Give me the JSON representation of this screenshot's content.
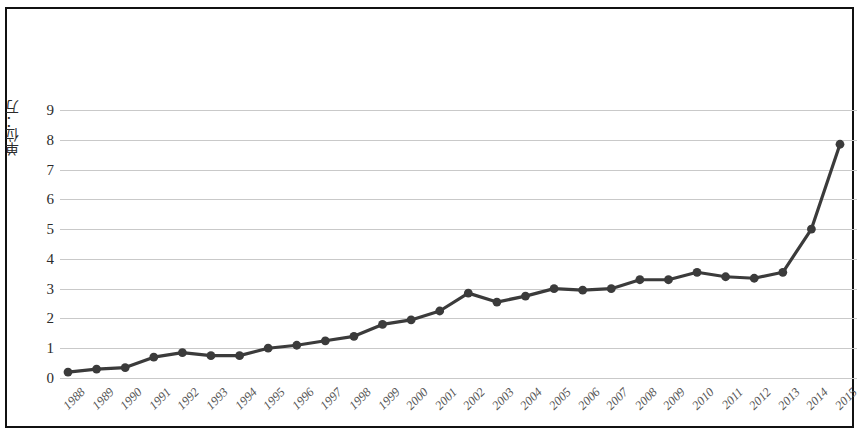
{
  "chart_data": {
    "type": "line",
    "title": "",
    "xlabel": "",
    "ylabel": "单位：万",
    "categories": [
      "1988",
      "1989",
      "1990",
      "1991",
      "1992",
      "1993",
      "1994",
      "1995",
      "1996",
      "1997",
      "1998",
      "1999",
      "2000",
      "2001",
      "2002",
      "2003",
      "2004",
      "2005",
      "2006",
      "2007",
      "2008",
      "2009",
      "2010",
      "2011",
      "2012",
      "2013",
      "2014",
      "2015"
    ],
    "values": [
      0.2,
      0.3,
      0.35,
      0.7,
      0.85,
      0.75,
      0.75,
      1.0,
      1.1,
      1.25,
      1.4,
      1.8,
      1.95,
      2.25,
      2.85,
      2.55,
      2.75,
      3.0,
      2.95,
      3.0,
      3.3,
      3.3,
      3.55,
      3.4,
      3.35,
      3.55,
      5.0,
      7.85
    ],
    "series": [
      {
        "name": "",
        "values": [
          0.2,
          0.3,
          0.35,
          0.7,
          0.85,
          0.75,
          0.75,
          1.0,
          1.1,
          1.25,
          1.4,
          1.8,
          1.95,
          2.25,
          2.85,
          2.55,
          2.75,
          3.0,
          2.95,
          3.0,
          3.3,
          3.3,
          3.55,
          3.4,
          3.35,
          3.55,
          5.0,
          7.85
        ]
      }
    ],
    "ylim": [
      0,
      9
    ],
    "yticks": [
      0,
      1,
      2,
      3,
      4,
      5,
      6,
      7,
      8,
      9
    ],
    "ytick_labels": [
      "0",
      "1",
      "2",
      "3",
      "4",
      "5",
      "6",
      "7",
      "8",
      "9"
    ],
    "grid": true,
    "legend": false,
    "legend_position": "none",
    "line_color": "#3b3b3b",
    "marker_color": "#3b3b3b",
    "marker": "circle",
    "gridline_color": "#c9c9c9",
    "border_color": "#111111",
    "background_color": "#ffffff"
  }
}
